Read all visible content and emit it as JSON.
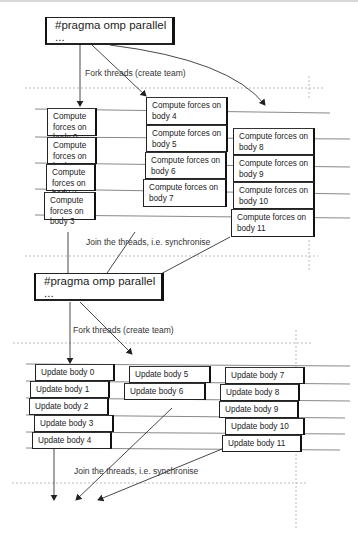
{
  "diagram": {
    "region1": {
      "pragma": "#pragma omp parallel ...",
      "fork_label": "Fork threads (create team)",
      "join_label": "Join the threads, i.e. synchronise",
      "threads": [
        {
          "tasks": [
            "Compute forces on body 0",
            "Compute forces on body 1",
            "Compute forces on body 2",
            "Compute forces on body 3"
          ]
        },
        {
          "tasks": [
            "Compute forces on body 4",
            "Compute forces on body 5",
            "Compute forces on body 6",
            "Compute forces on body 7"
          ]
        },
        {
          "tasks": [
            "Compute forces on body 8",
            "Compute forces on body 9",
            "Compute forces on body 10",
            "Compute forces on body 11"
          ]
        }
      ]
    },
    "region2": {
      "pragma": "#pragma omp parallel ...",
      "fork_label": "Fork threads (create team)",
      "join_label": "Join the threads, i.e. synchronise",
      "threads": [
        {
          "tasks": [
            "Update body 0",
            "Update body 1",
            "Update body 2",
            "Update body 3",
            "Update body 4"
          ]
        },
        {
          "tasks": [
            "Update body 5",
            "Update body 6"
          ]
        },
        {
          "tasks": [
            "Update body 7",
            "Update body 8",
            "Update body 9",
            "Update body 10",
            "Update body 11"
          ]
        }
      ]
    }
  }
}
